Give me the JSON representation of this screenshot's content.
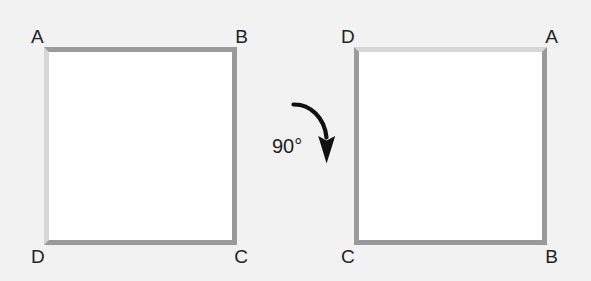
{
  "diagram": {
    "background_color": "#f2f2f2",
    "shape_fill_color": "#ffffff",
    "edge_dark_color": "#9a9a9a",
    "edge_light_color": "#d6d6d6",
    "label_color": "#232323"
  },
  "square_before": {
    "name": "square-before-rotation",
    "corners": {
      "top_left": "A",
      "top_right": "B",
      "bottom_right": "C",
      "bottom_left": "D"
    }
  },
  "square_after": {
    "name": "square-after-rotation",
    "corners": {
      "top_left": "D",
      "top_right": "A",
      "bottom_right": "B",
      "bottom_left": "C"
    }
  },
  "rotation": {
    "angle_label": "90°",
    "angle_value": 90,
    "direction": "clockwise",
    "arrow_color": "#111111"
  }
}
